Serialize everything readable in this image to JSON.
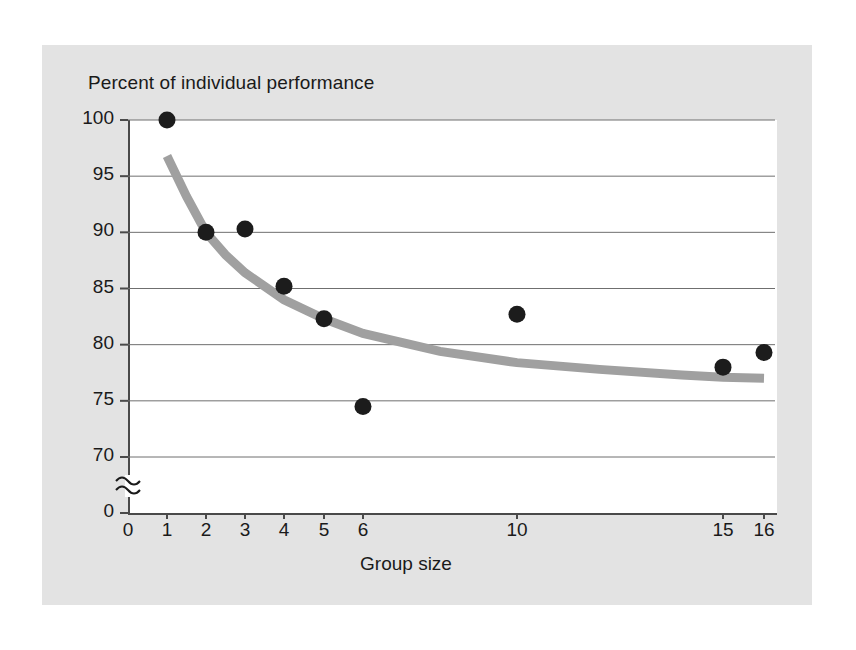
{
  "figure": {
    "background_color": "#ffffff",
    "panel_color": "#e3e3e3",
    "plot_background": "#ffffff",
    "axis_color": "#4a4a4a",
    "gridline_color": "#6f6f6f",
    "point_color": "#1c1c1c",
    "curve_color": "#a0a0a0"
  },
  "chart_data": {
    "type": "scatter",
    "title": "Percent of individual performance",
    "subtitle": "",
    "xlabel": "Group size",
    "ylabel": "Percent of individual performance",
    "xlim": [
      0,
      16
    ],
    "ylim": [
      70,
      100
    ],
    "grid": true,
    "legend": "none",
    "axis_break": {
      "axis": "y",
      "symbol": "≈",
      "below_value": 70,
      "baseline_value": 0
    },
    "y_ticks": [
      100,
      95,
      90,
      85,
      80,
      75,
      70,
      0
    ],
    "y_tick_labels": [
      "100",
      "95",
      "90",
      "85",
      "80",
      "75",
      "70",
      "0"
    ],
    "x_ticks": [
      0,
      1,
      2,
      3,
      4,
      5,
      6,
      10,
      15,
      16
    ],
    "x_tick_labels": [
      "0",
      "1",
      "2",
      "3",
      "4",
      "5",
      "6",
      "10",
      "15",
      "16"
    ],
    "x_scale_note": "non-linear: ticks 0-6 evenly spaced, gap to 10, then 15 and 16",
    "series": [
      {
        "name": "Observed group performance",
        "type": "scatter",
        "marker": "filled-circle",
        "color": "#1c1c1c",
        "x": [
          1,
          2,
          3,
          4,
          5,
          6,
          10,
          15,
          16
        ],
        "y": [
          100,
          90,
          90.3,
          85.2,
          82.3,
          74.5,
          82.7,
          78,
          79.3
        ],
        "points": [
          {
            "x": 1,
            "y": 100
          },
          {
            "x": 2,
            "y": 90
          },
          {
            "x": 3,
            "y": 90.3
          },
          {
            "x": 4,
            "y": 85.2
          },
          {
            "x": 5,
            "y": 82.3
          },
          {
            "x": 6,
            "y": 74.5
          },
          {
            "x": 10,
            "y": 82.7
          },
          {
            "x": 15,
            "y": 78
          },
          {
            "x": 16,
            "y": 79.3
          }
        ]
      },
      {
        "name": "Fitted decay curve",
        "type": "line",
        "color": "#a0a0a0",
        "x": [
          1,
          1.5,
          2,
          2.5,
          3,
          4,
          5,
          6,
          8,
          10,
          12,
          14,
          15,
          16
        ],
        "y": [
          96.8,
          93.2,
          90.0,
          88.0,
          86.4,
          84.0,
          82.3,
          81.0,
          79.4,
          78.4,
          77.8,
          77.3,
          77.1,
          77.0
        ]
      }
    ]
  },
  "labels": {
    "title": "Percent of individual performance",
    "xaxis_title": "Group size",
    "break_symbol": "≈"
  }
}
